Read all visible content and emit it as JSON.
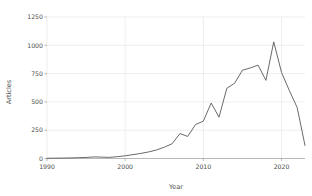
{
  "chart_data": {
    "type": "line",
    "title": "",
    "xlabel": "Year",
    "ylabel": "Articles",
    "xlim": [
      1990,
      2023
    ],
    "ylim": [
      0,
      1250
    ],
    "grid": true,
    "legend": false,
    "line_color": "#595959",
    "grid_color": "#e2e2e2",
    "axis_color": "#9a9a9a",
    "background": "#ffffff",
    "x_ticks": [
      1990,
      2000,
      2010,
      2020
    ],
    "x_tick_labels": [
      "1990",
      "2000",
      "2010",
      "2020"
    ],
    "y_ticks": [
      0,
      250,
      500,
      750,
      1000,
      1250
    ],
    "y_tick_labels": [
      "0",
      "250",
      "500",
      "750",
      "1000",
      "1250"
    ],
    "series": [
      {
        "name": "Articles",
        "x": [
          1990,
          1991,
          1992,
          1993,
          1994,
          1995,
          1996,
          1997,
          1998,
          1999,
          2000,
          2001,
          2002,
          2003,
          2004,
          2005,
          2006,
          2007,
          2008,
          2009,
          2010,
          2011,
          2012,
          2013,
          2014,
          2015,
          2016,
          2017,
          2018,
          2019,
          2020,
          2021,
          2022,
          2023
        ],
        "values": [
          2,
          3,
          4,
          5,
          7,
          9,
          14,
          12,
          10,
          16,
          24,
          34,
          45,
          58,
          75,
          100,
          130,
          220,
          195,
          300,
          330,
          490,
          365,
          620,
          665,
          780,
          800,
          825,
          690,
          1030,
          760,
          600,
          450,
          115
        ]
      }
    ]
  },
  "axes": {
    "y_label_text": "Articles",
    "x_label_text": "Year"
  }
}
